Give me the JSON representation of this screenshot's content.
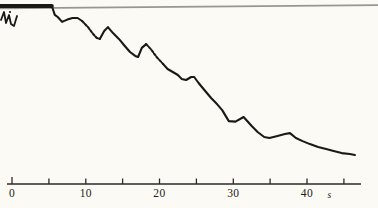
{
  "colors": {
    "background": "#fbfaf5",
    "reference_line": "#9b968d",
    "trace": "#1b1916",
    "axis": "#2c2a26",
    "label": "#1e1c19"
  },
  "chart_data": {
    "type": "line",
    "title": "",
    "xlabel": "s",
    "ylabel": "",
    "grid": false,
    "legend": null,
    "x_axis": {
      "unit": "s",
      "min": 0,
      "max": 45,
      "tick_interval": 5,
      "ticks": [
        {
          "t": 0,
          "label": "0"
        },
        {
          "t": 5,
          "label": ""
        },
        {
          "t": 10,
          "label": "10"
        },
        {
          "t": 15,
          "label": ""
        },
        {
          "t": 20,
          "label": "20"
        },
        {
          "t": 25,
          "label": ""
        },
        {
          "t": 30,
          "label": "30"
        },
        {
          "t": 35,
          "label": ""
        },
        {
          "t": 40,
          "label": "40"
        },
        {
          "t": 45,
          "label": ""
        }
      ]
    },
    "y_axis": {
      "label": "",
      "scale_note": "relative pen deflection; top reference line = 1.0, baseline = 0"
    },
    "reference_line": {
      "value": 1.0,
      "extent": "full width"
    },
    "series": [
      {
        "name": "recorder-trace",
        "segments": [
          {
            "style": "thick",
            "points": [
              [
                -1.6,
                1.0
              ],
              [
                2.0,
                1.0
              ],
              [
                5.4,
                1.0
              ]
            ]
          },
          {
            "style": "solid",
            "points": [
              [
                5.4,
                1.0
              ],
              [
                5.8,
                0.95
              ],
              [
                6.2,
                0.938
              ],
              [
                6.8,
                0.91
              ],
              [
                7.5,
                0.923
              ],
              [
                8.2,
                0.932
              ],
              [
                8.9,
                0.932
              ],
              [
                9.5,
                0.915
              ]
            ]
          },
          {
            "style": "dotted",
            "points": [
              [
                9.5,
                0.915
              ],
              [
                10.3,
                0.881
              ],
              [
                11.0,
                0.842
              ],
              [
                11.5,
                0.819
              ],
              [
                11.9,
                0.814
              ]
            ]
          },
          {
            "style": "solid",
            "points": [
              [
                11.9,
                0.814
              ],
              [
                12.5,
                0.859
              ],
              [
                13.0,
                0.881
              ],
              [
                13.7,
                0.847
              ],
              [
                14.5,
                0.814
              ],
              [
                15.3,
                0.774
              ],
              [
                16.0,
                0.74
              ],
              [
                16.7,
                0.718
              ],
              [
                17.1,
                0.712
              ],
              [
                17.6,
                0.763
              ],
              [
                18.2,
                0.785
              ]
            ]
          },
          {
            "style": "dotted",
            "points": [
              [
                18.2,
                0.785
              ],
              [
                18.8,
                0.757
              ],
              [
                19.6,
                0.712
              ],
              [
                20.5,
                0.672
              ]
            ]
          },
          {
            "style": "solid",
            "points": [
              [
                20.5,
                0.672
              ],
              [
                21.1,
                0.644
              ],
              [
                21.8,
                0.627
              ],
              [
                22.5,
                0.61
              ],
              [
                23.0,
                0.588
              ],
              [
                23.6,
                0.582
              ],
              [
                24.3,
                0.599
              ],
              [
                24.7,
                0.599
              ],
              [
                25.3,
                0.565
              ],
              [
                26.2,
                0.52
              ],
              [
                27.0,
                0.48
              ],
              [
                27.8,
                0.446
              ],
              [
                28.5,
                0.412
              ],
              [
                29.4,
                0.35
              ],
              [
                30.3,
                0.347
              ],
              [
                31.4,
                0.373
              ],
              [
                32.5,
                0.322
              ],
              [
                33.3,
                0.288
              ],
              [
                34.2,
                0.26
              ],
              [
                34.9,
                0.254
              ],
              [
                36.0,
                0.266
              ],
              [
                37.0,
                0.277
              ],
              [
                37.7,
                0.282
              ],
              [
                38.5,
                0.254
              ],
              [
                39.4,
                0.237
              ],
              [
                40.4,
                0.22
              ],
              [
                41.5,
                0.203
              ],
              [
                42.6,
                0.192
              ],
              [
                43.6,
                0.181
              ],
              [
                44.7,
                0.169
              ],
              [
                45.8,
                0.164
              ],
              [
                46.5,
                0.158
              ]
            ]
          }
        ]
      }
    ],
    "start_artifact_px": {
      "zigzag": [
        [
          1,
          20
        ],
        [
          4,
          12
        ],
        [
          6,
          23
        ],
        [
          9,
          15
        ],
        [
          11,
          24
        ],
        [
          14,
          26
        ],
        [
          17,
          16
        ]
      ],
      "dot": [
        10,
        12
      ]
    }
  }
}
